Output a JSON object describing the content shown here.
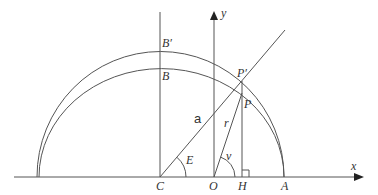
{
  "diagram": {
    "labels": {
      "B_prime": "B′",
      "B": "B",
      "P_prime": "P′",
      "P": "P",
      "a": "a",
      "r": "r",
      "E": "E",
      "v": "v",
      "C": "C",
      "O": "O",
      "H": "H",
      "A": "A",
      "x": "x",
      "y": "y"
    },
    "elements": [
      {
        "name": "auxiliary-circle",
        "type": "semicircle",
        "center": "C"
      },
      {
        "name": "ellipse",
        "type": "half-ellipse",
        "center": "C"
      },
      {
        "name": "x-axis",
        "type": "arrow"
      },
      {
        "name": "y-axis",
        "type": "arrow",
        "origin": "O"
      },
      {
        "name": "line-C-Bprime",
        "type": "vertical-line"
      },
      {
        "name": "line-C-Pprime",
        "label": "a"
      },
      {
        "name": "line-O-P",
        "label": "r"
      },
      {
        "name": "line-Pprime-H",
        "type": "vertical-line"
      },
      {
        "name": "right-angle-marker",
        "at": "H"
      },
      {
        "name": "angle-E",
        "at": "C"
      },
      {
        "name": "angle-v",
        "at": "O"
      }
    ],
    "colors": {
      "stroke": "#555555",
      "text": "#333333",
      "background": "#ffffff"
    }
  }
}
